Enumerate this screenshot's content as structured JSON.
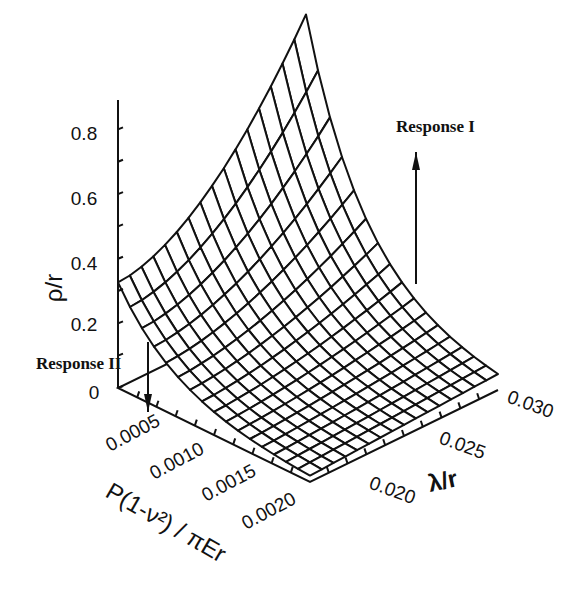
{
  "chart_data": {
    "type": "surface3d",
    "title": "",
    "z_axis": {
      "label": "ρ/r",
      "ticks": [
        "0",
        "0.2",
        "0.4",
        "0.6",
        "0.8"
      ],
      "range": [
        0,
        0.9
      ]
    },
    "x_axis": {
      "label": "P(1-ν²) / πEr",
      "ticks": [
        "0.0005",
        "0.0010",
        "0.0015",
        "0.0020"
      ],
      "range": [
        0.0002,
        0.0022
      ]
    },
    "y_axis": {
      "label": "λ/r",
      "ticks": [
        "0.020",
        "0.025",
        "0.030"
      ],
      "range": [
        0.017,
        0.032
      ]
    },
    "grid_x_count": 17,
    "grid_y_count": 17,
    "corner_values": {
      "low_load_low_lambda": 0.33,
      "low_load_high_lambda": 0.88,
      "high_load_low_lambda": 0.02,
      "high_load_high_lambda": 0.05
    },
    "annotations": [
      {
        "text": "Response I",
        "direction": "up"
      },
      {
        "text": "Response II",
        "direction": "down"
      }
    ],
    "grid": false,
    "legend": "none"
  }
}
